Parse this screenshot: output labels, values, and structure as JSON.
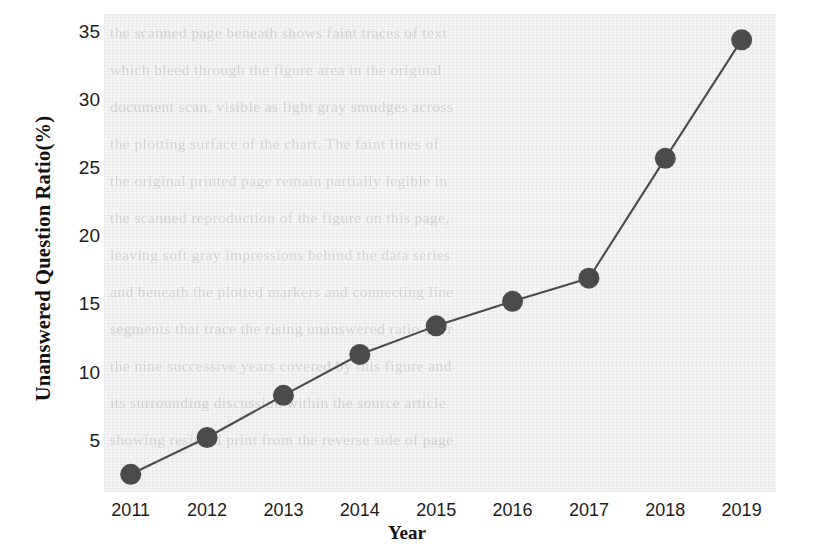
{
  "chart_data": {
    "type": "line",
    "title": "",
    "xlabel": "Year",
    "ylabel": "Unanswered Question Ratio(%)",
    "categories": [
      "2011",
      "2012",
      "2013",
      "2014",
      "2015",
      "2016",
      "2017",
      "2018",
      "2019"
    ],
    "x": [
      2011,
      2012,
      2013,
      2014,
      2015,
      2016,
      2017,
      2018,
      2019
    ],
    "values": [
      2.6,
      5.3,
      8.4,
      11.4,
      13.5,
      15.3,
      17.0,
      25.8,
      34.5
    ],
    "series": [
      {
        "name": "Unanswered Question Ratio(%)",
        "values": [
          2.6,
          5.3,
          8.4,
          11.4,
          13.5,
          15.3,
          17.0,
          25.8,
          34.5
        ]
      }
    ],
    "xlim": [
      2010.65,
      2019.45
    ],
    "ylim": [
      1.3,
      36.4
    ],
    "yticks": [
      5,
      10,
      15,
      20,
      25,
      30,
      35
    ],
    "ytick_labels": [
      "5",
      "10",
      "15",
      "20",
      "25",
      "30",
      "35"
    ],
    "xticks": [
      2011,
      2012,
      2013,
      2014,
      2015,
      2016,
      2017,
      2018,
      2019
    ],
    "xtick_labels": [
      "2011",
      "2012",
      "2013",
      "2014",
      "2015",
      "2016",
      "2017",
      "2018",
      "2019"
    ],
    "grid": false,
    "legend": "none",
    "marker": "circle",
    "marker_color": "#4b4b4b",
    "line_color": "#4b4b4b",
    "plot_background_color": "#f3f3f4",
    "figure_background_color": "#ffffff",
    "text_color": "#1c1c1c"
  },
  "background_ghost_text": [
    "the scanned page beneath shows faint traces of text",
    "which bleed through the figure area in the original",
    "document scan, visible as light gray smudges across",
    "the plotting surface of the chart. The faint lines of",
    "the original printed page remain partially legible in",
    "the scanned reproduction of the figure on this page,",
    "leaving soft gray impressions behind the data series",
    "and beneath the plotted markers and connecting line",
    "segments that trace the rising unanswered ratio over",
    "the nine successive years covered by this figure and",
    "its surrounding discussion within the source article",
    "showing residual print from the reverse side of page"
  ]
}
